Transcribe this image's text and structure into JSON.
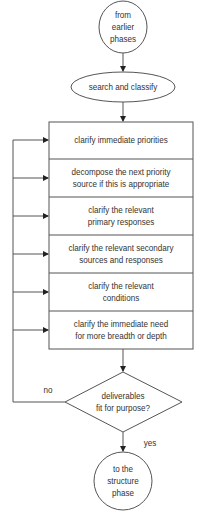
{
  "diagram": {
    "type": "flowchart",
    "start": {
      "label_lines": [
        "from",
        "earlier",
        "phases"
      ]
    },
    "step": {
      "label": "search and classify"
    },
    "process_box": {
      "rows": [
        {
          "lines": [
            "clarify immediate priorities"
          ]
        },
        {
          "lines": [
            "decompose the next priority",
            "source if this is appropriate"
          ]
        },
        {
          "lines": [
            "clarify the relevant",
            "primary responses"
          ]
        },
        {
          "lines": [
            "clarify the relevant secondary",
            "sources and responses"
          ]
        },
        {
          "lines": [
            "clarify the relevant",
            "conditions"
          ]
        },
        {
          "lines": [
            "clarify the immediate need",
            "for more breadth or depth"
          ]
        }
      ]
    },
    "decision": {
      "lines": [
        "deliverables",
        "fit for purpose?"
      ],
      "no_label": "no",
      "yes_label": "yes"
    },
    "end": {
      "label_lines": [
        "to the",
        "structure",
        "phase"
      ]
    },
    "colors": {
      "stroke": "#555555",
      "text": "#333333",
      "background": "#ffffff"
    }
  }
}
